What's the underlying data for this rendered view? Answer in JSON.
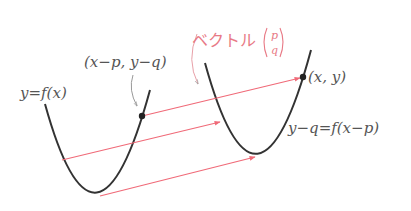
{
  "labels": {
    "original_curve": "y=f(x)",
    "original_point": "(x−p,  y−q)",
    "moved_point": "(x,  y)",
    "moved_curve": "y−q=f(x−p)",
    "vector_word": "ベクトル",
    "vector_p": "p",
    "vector_q": "q"
  },
  "colors": {
    "curve": "#333333",
    "arrow": "#f06a78",
    "text": "#555555",
    "vector_label": "#e87a86"
  }
}
